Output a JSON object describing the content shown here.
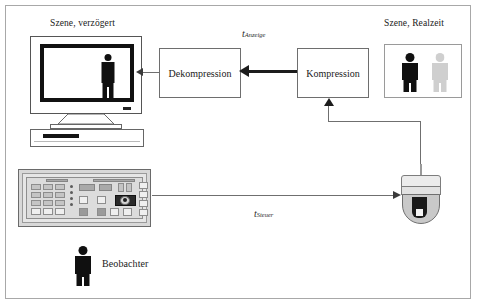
{
  "diagram": {
    "title_left": "Szene, verzögert",
    "title_right": "Szene, Realzeit",
    "boxes": {
      "dekompression": "Dekompression",
      "kompression": "Kompression"
    },
    "timing_labels": {
      "display": {
        "base": "t",
        "sub": "Anzeige"
      },
      "control": {
        "base": "t",
        "sub": "Steuer"
      }
    },
    "actor": {
      "label": "Beobachter"
    },
    "icons": {
      "monitor": "crt-monitor-icon",
      "person_solid": "person-pictogram-icon",
      "person_ghost": "person-ghost-pictogram-icon",
      "console": "control-console-icon",
      "camera": "dome-camera-icon",
      "observer": "observer-person-icon"
    },
    "colors": {
      "line": "#6f6f6f",
      "thick_line": "#1c1c1c",
      "box_border": "#6e6e6e",
      "frame_border": "#a8a8a8",
      "pictogram": "#101010",
      "ghost": "#8e8e8e",
      "console_body": "#d8d8d8",
      "camera_dome": "#c9c9c9"
    }
  }
}
